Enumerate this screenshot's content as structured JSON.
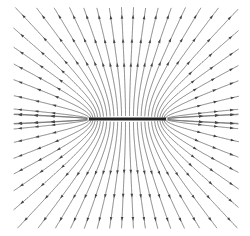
{
  "diagram": {
    "type": "field-lines",
    "canvas": {
      "width": 250,
      "height": 236,
      "background": "#ffffff"
    },
    "rod": {
      "x1": 89,
      "x2": 166,
      "y": 119,
      "thickness": 3,
      "color": "#222222",
      "charge": "positive"
    },
    "field": {
      "direction": "outward",
      "line_color": "#666666",
      "arrow_color": "#444444",
      "line_width": 0.8,
      "num_lines": 64,
      "bounds": {
        "left": 14,
        "right": 238,
        "top": 8,
        "bottom": 228
      },
      "arrows_per_line": 3
    }
  }
}
